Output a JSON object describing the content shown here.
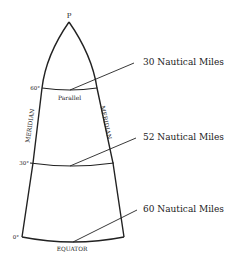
{
  "diagram": {
    "pole_label": "P",
    "latitudes": [
      {
        "label": "60°",
        "y": 88
      },
      {
        "label": "30°",
        "y": 163
      },
      {
        "label": "0°",
        "y": 237
      }
    ],
    "parallel_label": "Parallel",
    "meridian_left_label": "MERIDIAN",
    "meridian_right_label": "MERIDIAN",
    "equator_label": "EQUATOR",
    "callouts": [
      {
        "text": "30 Nautical Miles"
      },
      {
        "text": "52 Nautical Miles"
      },
      {
        "text": "60 Nautical Miles"
      }
    ],
    "line_color": "#222222",
    "background": "#ffffff"
  }
}
